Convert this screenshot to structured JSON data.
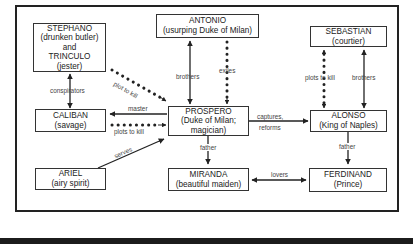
{
  "diagram": {
    "nodes": [
      {
        "id": "stephano",
        "lines": [
          "STEPHANO",
          "(drunken butler)",
          "and",
          "TRINCULO",
          "(jester)"
        ]
      },
      {
        "id": "antonio",
        "lines": [
          "ANTONIO",
          "(usurping Duke of Milan)"
        ]
      },
      {
        "id": "sebastian",
        "lines": [
          "SEBASTIAN",
          "(courtier)"
        ]
      },
      {
        "id": "caliban",
        "lines": [
          "CALIBAN",
          "(savage)"
        ]
      },
      {
        "id": "prospero",
        "lines": [
          "PROSPERO",
          "(Duke of Milan;",
          "magician)"
        ]
      },
      {
        "id": "alonso",
        "lines": [
          "ALONSO",
          "(King of Naples)"
        ]
      },
      {
        "id": "ariel",
        "lines": [
          "ARIEL",
          "(airy spirit)"
        ]
      },
      {
        "id": "miranda",
        "lines": [
          "MIRANDA",
          "(beautiful maiden)"
        ]
      },
      {
        "id": "ferdinand",
        "lines": [
          "FERDINAND",
          "(Prince)"
        ]
      }
    ],
    "edges": [
      {
        "from": "stephano",
        "to": "caliban",
        "label": "conspirators",
        "style": "solid",
        "direction": "both"
      },
      {
        "from": "stephano",
        "to": "prospero",
        "label": "plot to kill",
        "style": "dotted",
        "direction": "forward"
      },
      {
        "from": "antonio",
        "to": "prospero",
        "label": "brothers",
        "style": "solid",
        "direction": "both"
      },
      {
        "from": "antonio",
        "to": "prospero",
        "label": "exiles",
        "style": "dotted",
        "direction": "forward"
      },
      {
        "from": "sebastian",
        "to": "alonso",
        "label": "plots to kill",
        "style": "dotted",
        "direction": "both"
      },
      {
        "from": "sebastian",
        "to": "alonso",
        "label": "brothers",
        "style": "solid",
        "direction": "both"
      },
      {
        "from": "prospero",
        "to": "caliban",
        "label": "master",
        "style": "solid",
        "direction": "forward"
      },
      {
        "from": "caliban",
        "to": "prospero",
        "label": "plots to kill",
        "style": "dotted",
        "direction": "forward"
      },
      {
        "from": "ariel",
        "to": "prospero",
        "label": "serves",
        "style": "solid",
        "direction": "forward"
      },
      {
        "from": "prospero",
        "to": "alonso",
        "label": "captures, reforms",
        "label_lines": [
          "captures,",
          "reforms"
        ],
        "style": "solid",
        "direction": "forward"
      },
      {
        "from": "prospero",
        "to": "miranda",
        "label": "father",
        "style": "solid",
        "direction": "forward"
      },
      {
        "from": "alonso",
        "to": "ferdinand",
        "label": "father",
        "style": "solid",
        "direction": "forward"
      },
      {
        "from": "miranda",
        "to": "ferdinand",
        "label": "lovers",
        "style": "solid",
        "direction": "both"
      }
    ]
  }
}
